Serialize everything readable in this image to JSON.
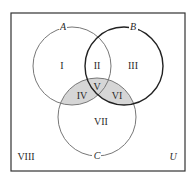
{
  "diagram": {
    "type": "venn-3-set",
    "universe_label": "U",
    "sets": [
      {
        "name": "A",
        "cx": 72,
        "cy": 66,
        "r": 39,
        "stroke": "#777777",
        "stroke_width": 1
      },
      {
        "name": "B",
        "cx": 124,
        "cy": 66,
        "r": 39,
        "stroke": "#222222",
        "stroke_width": 1.4
      },
      {
        "name": "C",
        "cx": 97,
        "cy": 117,
        "r": 39,
        "stroke": "#777777",
        "stroke_width": 1
      }
    ],
    "regions": [
      {
        "label": "I",
        "x": 62,
        "y": 68
      },
      {
        "label": "II",
        "x": 97,
        "y": 68
      },
      {
        "label": "III",
        "x": 133,
        "y": 68
      },
      {
        "label": "IV",
        "x": 82,
        "y": 98
      },
      {
        "label": "V",
        "x": 97,
        "y": 89
      },
      {
        "label": "VI",
        "x": 116,
        "y": 98
      },
      {
        "label": "VII",
        "x": 101,
        "y": 124
      },
      {
        "label": "VIII",
        "x": 26,
        "y": 159
      }
    ],
    "shaded_regions": [
      "IV",
      "V",
      "VI"
    ],
    "shade_color": "#d6d6d6",
    "box": {
      "x": 11,
      "y": 13,
      "width": 174,
      "height": 158,
      "stroke": "#333333"
    }
  }
}
